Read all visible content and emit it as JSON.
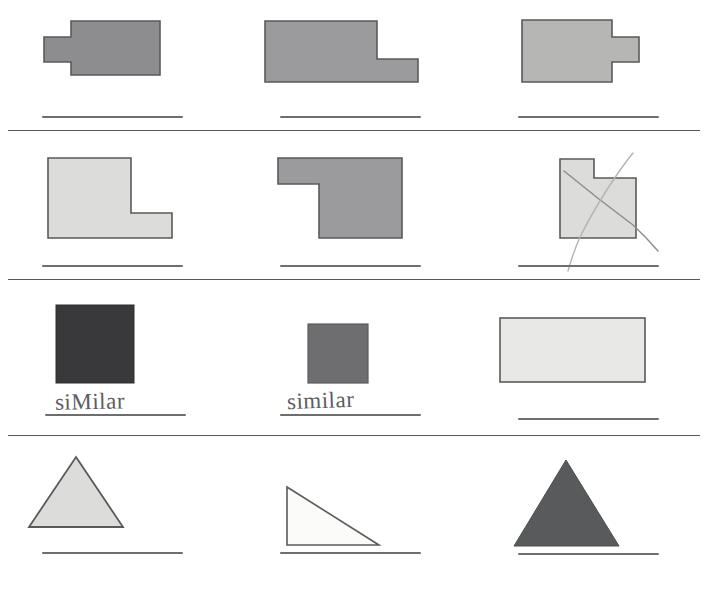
{
  "worksheet": {
    "top_text": "congruent or similar shapes (cut off)",
    "colors": {
      "ink": "#58585a",
      "line": "#6e6e70",
      "shape_outline": "#5a5a5c",
      "dark_gray": "#3b3b3d",
      "medium_gray": "#919193",
      "mid_dark_gray": "#828284",
      "light_gray": "#d8d8d6",
      "pale_gray": "#e6e6e4",
      "near_white": "#fbfbfa",
      "pencil": "#a9a9a7"
    },
    "rows": [
      {
        "id": "row-1",
        "cells": [
          {
            "id": "r1c1",
            "shape_name": "rectangle-with-left-tab",
            "fill": "#8d8d8f",
            "answer": "",
            "answer_line": true
          },
          {
            "id": "r1c2",
            "shape_name": "l-shape-bottom-right-extension",
            "fill": "#9b9b9d",
            "answer": "",
            "answer_line": true
          },
          {
            "id": "r1c3",
            "shape_name": "rectangle-with-right-tab",
            "fill": "#b6b6b4",
            "answer": "",
            "answer_line": true
          }
        ]
      },
      {
        "id": "row-2",
        "cells": [
          {
            "id": "r2c1",
            "shape_name": "l-shape-notch-bottom-right",
            "fill": "#dcdcda",
            "answer": "",
            "answer_line": true
          },
          {
            "id": "r2c2",
            "shape_name": "l-shape-notch-bottom-left",
            "fill": "#9b9b9d",
            "answer": "",
            "answer_line": true
          },
          {
            "id": "r2c3",
            "shape_name": "l-shape-notch-top-right-crossed-out",
            "fill": "#dcdcda",
            "answer": "",
            "answer_line": true,
            "crossed_out": true
          }
        ]
      },
      {
        "id": "row-3",
        "cells": [
          {
            "id": "r3c1",
            "shape_name": "large-dark-square",
            "fill": "#39393b",
            "answer": "siMilar",
            "answer_line": true
          },
          {
            "id": "r3c2",
            "shape_name": "small-gray-square",
            "fill": "#6e6e70",
            "answer": "similar",
            "answer_line": true
          },
          {
            "id": "r3c3",
            "shape_name": "wide-light-rectangle",
            "fill": "#e8e8e6",
            "answer": "",
            "answer_line": true
          }
        ]
      },
      {
        "id": "row-4",
        "cells": [
          {
            "id": "r4c1",
            "shape_name": "light-isosceles-triangle",
            "fill": "#dcdcda",
            "answer": "",
            "answer_line": true
          },
          {
            "id": "r4c2",
            "shape_name": "white-right-triangle",
            "fill": "#fbfbfa",
            "answer": "",
            "answer_line": true
          },
          {
            "id": "r4c3",
            "shape_name": "dark-isosceles-triangle",
            "fill": "#595a5c",
            "answer": "",
            "answer_line": true
          }
        ]
      }
    ]
  }
}
